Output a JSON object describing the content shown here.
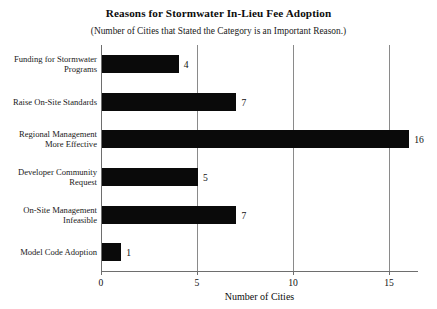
{
  "chart_data": {
    "type": "bar",
    "orientation": "horizontal",
    "title": "Reasons for Stormwater In-Lieu Fee Adoption",
    "subtitle": "(Number of Cities that Stated the Category is an Important Reason.)",
    "xlabel": "Number of Cities",
    "ylabel": "",
    "categories": [
      "Funding for Stormwater Programs",
      "Raise On-Site Standards",
      "Regional Management More Effective",
      "Developer Community Request",
      "On-Site Management Infeasible",
      "Model Code Adoption"
    ],
    "category_lines": [
      [
        "Funding for Stormwater",
        "Programs"
      ],
      [
        "Raise On-Site Standards"
      ],
      [
        "Regional Management",
        "More Effective"
      ],
      [
        "Developer Community",
        "Request"
      ],
      [
        "On-Site Management",
        "Infeasible"
      ],
      [
        "Model Code Adoption"
      ]
    ],
    "values": [
      4,
      7,
      16,
      5,
      7,
      1
    ],
    "value_labels": [
      "4",
      "7",
      "16",
      "5",
      "7",
      "1"
    ],
    "xlim": [
      0,
      16.5
    ],
    "xticks": [
      0,
      5,
      10,
      15
    ],
    "xtick_labels": [
      "0",
      "5",
      "10",
      "15"
    ],
    "grid": "vertical",
    "legend": "none",
    "bar_color": "#0a0a0a",
    "grid_color": "#8a8a8a",
    "axis_color": "#6e6e6e"
  }
}
